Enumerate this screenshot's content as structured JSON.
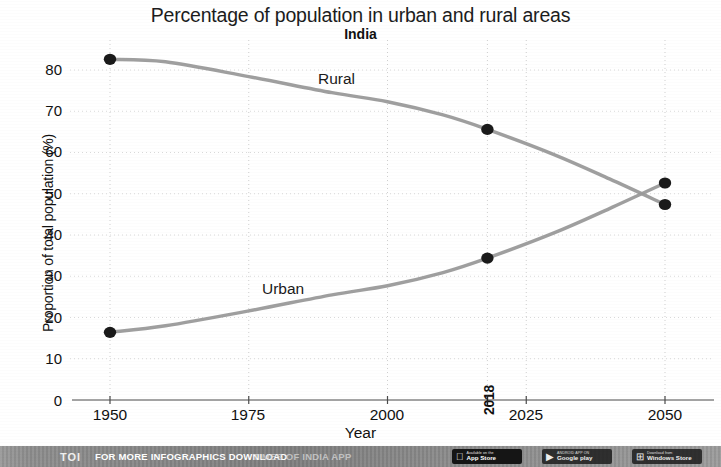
{
  "chart_data": {
    "type": "line",
    "title": "Percentage of population in urban and rural areas",
    "subtitle": "India",
    "xlabel": "Year",
    "ylabel": "Proportion of total population (%)",
    "xlim": [
      1950,
      2052
    ],
    "ylim": [
      0,
      85
    ],
    "xticks": [
      "1950",
      "1975",
      "2000",
      "2025",
      "2050"
    ],
    "xtick_values": [
      1950,
      1975,
      2000,
      2025,
      2050
    ],
    "highlight_xtick": "2018",
    "highlight_xtick_value": 2018,
    "yticks": [
      "0",
      "10",
      "20",
      "30",
      "40",
      "50",
      "60",
      "70",
      "80"
    ],
    "ytick_values": [
      0,
      10,
      20,
      30,
      40,
      50,
      60,
      70,
      80
    ],
    "grid": true,
    "grid_style": "dotted",
    "legend_position": "inline-labels",
    "line_color": "#9a9a9a",
    "marker_color": "#1a1a1a",
    "series": [
      {
        "name": "Rural",
        "label": "Rural",
        "x": [
          1950,
          1960,
          1975,
          1990,
          2000,
          2010,
          2018,
          2030,
          2040,
          2050
        ],
        "values": [
          82.6,
          82.0,
          78.4,
          74.5,
          72.3,
          69.1,
          65.6,
          59.5,
          53.6,
          47.4
        ],
        "markers": [
          {
            "x": 1950,
            "y": 82.6
          },
          {
            "x": 2018,
            "y": 65.6
          },
          {
            "x": 2050,
            "y": 47.4
          }
        ]
      },
      {
        "name": "Urban",
        "label": "Urban",
        "x": [
          1950,
          1960,
          1975,
          1990,
          2000,
          2010,
          2018,
          2030,
          2040,
          2050
        ],
        "values": [
          16.4,
          18.0,
          21.6,
          25.5,
          27.7,
          30.9,
          34.4,
          40.5,
          46.4,
          52.6
        ],
        "markers": [
          {
            "x": 1950,
            "y": 16.4
          },
          {
            "x": 2018,
            "y": 34.4
          },
          {
            "x": 2050,
            "y": 52.6
          }
        ]
      }
    ],
    "annotations": [
      {
        "text": "Rural",
        "x": 1988,
        "y": 76.5
      },
      {
        "text": "Urban",
        "x": 1978,
        "y": 28.5
      }
    ]
  },
  "footer": {
    "brand": "TOI",
    "cta": "FOR MORE  INFOGRAPHICS DOWNLOAD",
    "app_name": "TIMES OF INDIA APP",
    "badges": [
      {
        "id": "appstore",
        "glyph": "",
        "small": "Available on the",
        "big": "App Store"
      },
      {
        "id": "googleplay",
        "glyph": "▶",
        "small": "ANDROID APP ON",
        "big": "Google play"
      },
      {
        "id": "windows",
        "glyph": "⊞",
        "small": "Download from",
        "big": "Windows Store"
      }
    ]
  }
}
